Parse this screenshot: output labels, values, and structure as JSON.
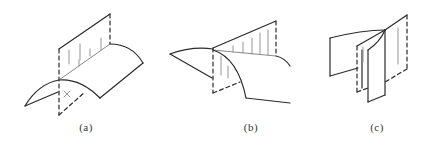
{
  "diagram": {
    "colors": {
      "line": "#2a2a2a",
      "hatch": "#8a8a8a",
      "background": "#ffffff"
    },
    "figures": [
      {
        "id": "a",
        "label": "(a)",
        "marker": "×"
      },
      {
        "id": "b",
        "label": "(b)"
      },
      {
        "id": "c",
        "label": "(c)"
      }
    ]
  }
}
